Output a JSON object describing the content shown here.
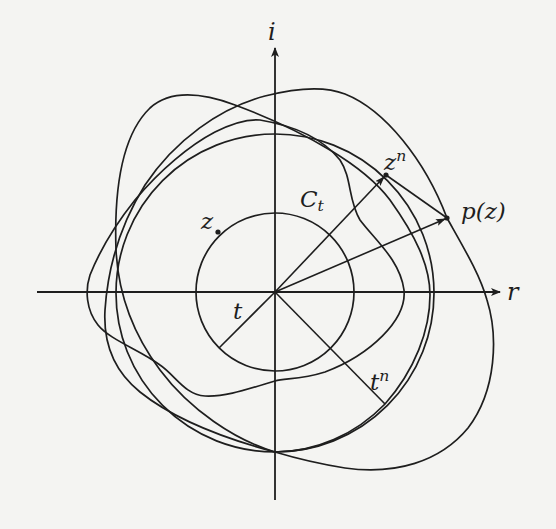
{
  "figure": {
    "axes": {
      "horizontal_label": "r",
      "vertical_label": "i"
    },
    "labels": {
      "circle": "C",
      "circle_sub": "t",
      "point_z": "z",
      "point_zn_base": "z",
      "point_zn_exp": "n",
      "point_pz": "p(z)",
      "radius_t": "t",
      "radius_tn_base": "t",
      "radius_tn_exp": "n"
    },
    "colors": {
      "ink": "#1e1e1e",
      "paper": "#f4f4f2"
    },
    "geometry": {
      "origin": [
        275,
        292
      ],
      "circle_Ct_radius": 79,
      "circle_tn_radius": 158,
      "point_z": [
        218,
        232
      ],
      "point_zn": [
        386,
        175
      ],
      "point_pz": [
        447,
        218
      ]
    }
  }
}
